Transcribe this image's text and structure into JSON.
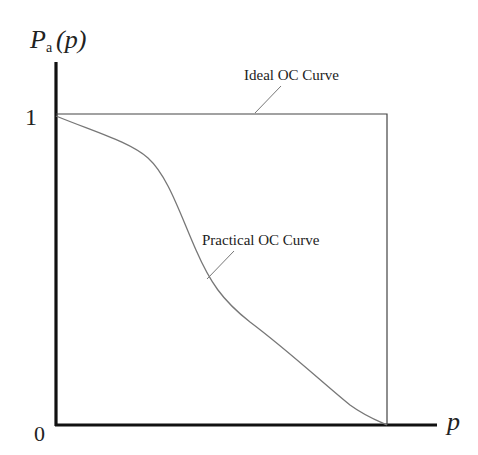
{
  "diagram": {
    "y_axis_label_main": "P",
    "y_axis_label_sub": "a",
    "y_axis_label_arg": "(p)",
    "x_axis_label": "p",
    "y_tick_top": "1",
    "origin_label": "0",
    "ideal_label": "Ideal OC Curve",
    "practical_label": "Practical OC Curve"
  },
  "colors": {
    "axis": "#111111",
    "ideal_curve": "#444444",
    "practical_curve": "#777777",
    "text": "#222222",
    "background": "#ffffff"
  }
}
